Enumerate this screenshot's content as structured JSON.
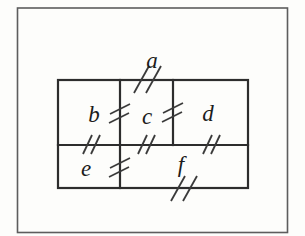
{
  "figure": {
    "labels": {
      "a": "a",
      "b": "b",
      "c": "c",
      "d": "d",
      "e": "e",
      "f": "f"
    },
    "colors": {
      "background": "#fdfdfb",
      "frame": "#5d5d5d",
      "wall": "#2d2d2d",
      "door_mark": "#3a3a3a",
      "label": "#1c1c1c"
    }
  }
}
